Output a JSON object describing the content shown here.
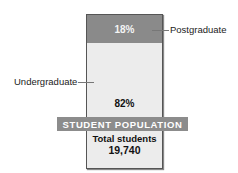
{
  "chart_data": {
    "type": "bar",
    "subtype": "stacked-100",
    "title": "STUDENT POPULATION",
    "categories": [
      "Student population"
    ],
    "series": [
      {
        "name": "Undergraduate",
        "values": [
          82
        ],
        "color": "#ececec"
      },
      {
        "name": "Postgraduate",
        "values": [
          18
        ],
        "color": "#8a8a8a"
      }
    ],
    "value_labels": {
      "Postgraduate": "18%",
      "Undergraduate": "82%"
    },
    "total_label": "Total students",
    "total_value": "19,740",
    "ylim": [
      0,
      100
    ]
  },
  "labels": {
    "postgraduate": "Postgraduate",
    "undergraduate": "Undergraduate",
    "post_pct": "18%",
    "under_pct": "82%",
    "banner": "STUDENT POPULATION",
    "total_label": "Total students",
    "total_value": "19,740"
  }
}
